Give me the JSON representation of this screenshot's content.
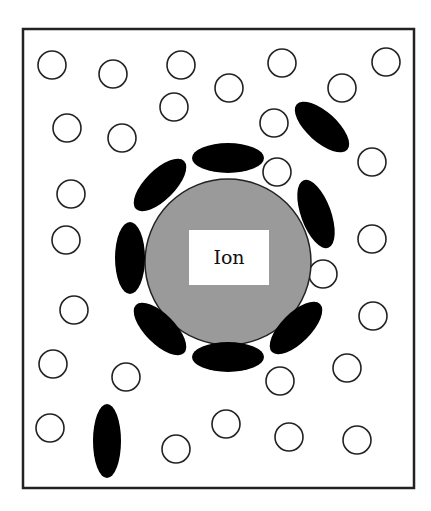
{
  "diagram": {
    "colors": {
      "background": "#ffffff",
      "border": "#222222",
      "ion_fill": "#9a9a9a",
      "solvent_polar": "#000000",
      "molecule_outline": "#222222"
    },
    "frame": {
      "x": 23,
      "y": 29,
      "width": 391,
      "height": 459
    },
    "ion": {
      "label": "Ion",
      "cx": 228,
      "cy": 262,
      "r": 83,
      "label_box": {
        "x": 189,
        "y": 230,
        "width": 80,
        "height": 55
      }
    },
    "polar_molecules": [
      {
        "cx": 228,
        "cy": 158,
        "rx": 36,
        "ry": 15,
        "rotate": 0
      },
      {
        "cx": 160,
        "cy": 185,
        "rx": 34,
        "ry": 15,
        "rotate": -45
      },
      {
        "cx": 316,
        "cy": 214,
        "rx": 36,
        "ry": 15,
        "rotate": 70
      },
      {
        "cx": 130,
        "cy": 258,
        "rx": 15,
        "ry": 36,
        "rotate": 0
      },
      {
        "cx": 160,
        "cy": 329,
        "rx": 34,
        "ry": 15,
        "rotate": 45
      },
      {
        "cx": 228,
        "cy": 357,
        "rx": 36,
        "ry": 15,
        "rotate": 0
      },
      {
        "cx": 296,
        "cy": 328,
        "rx": 34,
        "ry": 15,
        "rotate": -45
      },
      {
        "cx": 322,
        "cy": 127,
        "rx": 34,
        "ry": 15,
        "rotate": 42
      },
      {
        "cx": 107,
        "cy": 441,
        "rx": 14,
        "ry": 37,
        "rotate": 0
      }
    ],
    "nonpolar_molecules": [
      {
        "cx": 52,
        "cy": 65
      },
      {
        "cx": 113,
        "cy": 74
      },
      {
        "cx": 181,
        "cy": 65
      },
      {
        "cx": 229,
        "cy": 88
      },
      {
        "cx": 282,
        "cy": 63
      },
      {
        "cx": 342,
        "cy": 88
      },
      {
        "cx": 386,
        "cy": 62
      },
      {
        "cx": 174,
        "cy": 107
      },
      {
        "cx": 274,
        "cy": 123
      },
      {
        "cx": 67,
        "cy": 128
      },
      {
        "cx": 122,
        "cy": 138
      },
      {
        "cx": 372,
        "cy": 162
      },
      {
        "cx": 277,
        "cy": 172
      },
      {
        "cx": 71,
        "cy": 194
      },
      {
        "cx": 66,
        "cy": 240
      },
      {
        "cx": 372,
        "cy": 239
      },
      {
        "cx": 323,
        "cy": 274
      },
      {
        "cx": 74,
        "cy": 310
      },
      {
        "cx": 373,
        "cy": 316
      },
      {
        "cx": 53,
        "cy": 364
      },
      {
        "cx": 126,
        "cy": 377
      },
      {
        "cx": 280,
        "cy": 381
      },
      {
        "cx": 347,
        "cy": 368
      },
      {
        "cx": 50,
        "cy": 428
      },
      {
        "cx": 176,
        "cy": 449
      },
      {
        "cx": 226,
        "cy": 424
      },
      {
        "cx": 289,
        "cy": 437
      },
      {
        "cx": 357,
        "cy": 440
      }
    ],
    "nonpolar_radius": 14
  }
}
